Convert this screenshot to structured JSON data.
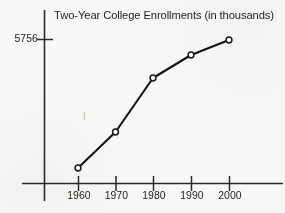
{
  "chart_data": {
    "type": "line",
    "title": "Two-Year College Enrollments (in thousands)",
    "xlabel": "",
    "ylabel": "",
    "categories": [
      "1960",
      "1970",
      "1980",
      "1990",
      "2000"
    ],
    "x": [
      1960,
      1970,
      1980,
      1990,
      2000
    ],
    "series": [
      {
        "name": "Two-Year College Enrollments",
        "values": [
          451,
          2319,
          4526,
          5240,
          5756
        ]
      }
    ],
    "y_tick_labels": [
      "5756"
    ],
    "y_tick_values": [
      5756
    ],
    "ylim": [
      0,
      6400
    ],
    "xlim": [
      1954,
      2010
    ],
    "grid": false,
    "legend": false,
    "legend_position": "none",
    "marker": "open-circle",
    "line_color": "#1a1a1a",
    "marker_fill": "#ffffff",
    "axis_color": "#2a2a2a",
    "annotations": []
  },
  "axes": {
    "y_axis_name": "vertical-axis",
    "x_axis_name": "horizontal-axis",
    "tick_mark_color": "#2a2a2a"
  },
  "points": [
    {
      "label": "1960",
      "value": "451",
      "cx": 78,
      "cy": 168
    },
    {
      "label": "1970",
      "value": "2319",
      "cx": 115.5,
      "cy": 132
    },
    {
      "label": "1980",
      "value": "4526",
      "cx": 153,
      "cy": 78
    },
    {
      "label": "1990",
      "value": "5240",
      "cx": 191,
      "cy": 55
    },
    {
      "label": "2000",
      "value": "5756",
      "cx": 229,
      "cy": 40
    }
  ],
  "tick_positions": {
    "x": [
      78,
      115.5,
      153,
      191,
      229
    ],
    "y": [
      39
    ]
  }
}
